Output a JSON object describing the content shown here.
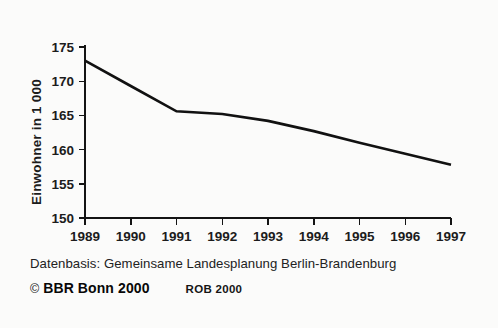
{
  "chart_data": {
    "type": "line",
    "title": "",
    "subtitle": "",
    "xlabel": "",
    "ylabel": "Einwohner in 1 000",
    "x": [
      1989,
      1990,
      1991,
      1992,
      1993,
      1994,
      1995,
      1996,
      1997
    ],
    "categories": [
      "1989",
      "1990",
      "1991",
      "1992",
      "1993",
      "1994",
      "1995",
      "1996",
      "1997"
    ],
    "values": [
      173.0,
      169.3,
      165.6,
      165.2,
      164.2,
      162.7,
      161.0,
      159.4,
      157.8
    ],
    "series": [
      {
        "name": "Einwohner",
        "values": [
          173.0,
          169.3,
          165.6,
          165.2,
          164.2,
          162.7,
          161.0,
          159.4,
          157.8
        ]
      }
    ],
    "ylim": [
      150,
      175
    ],
    "xlim": [
      1989,
      1997
    ],
    "yticks": [
      150,
      155,
      160,
      165,
      170,
      175
    ],
    "ytick_labels": [
      "150",
      "155",
      "160",
      "165",
      "170",
      "175"
    ],
    "xticks": [
      1989,
      1990,
      1991,
      1992,
      1993,
      1994,
      1995,
      1996,
      1997
    ],
    "xtick_labels": [
      "1989",
      "1990",
      "1991",
      "1992",
      "1993",
      "1994",
      "1995",
      "1996",
      "1997"
    ],
    "grid": false,
    "legend": false,
    "legend_position": "none",
    "line_color": "#111111",
    "background_color": "#fbfbfa"
  },
  "footer": {
    "source_note": "Datenbasis: Gemeinsame Landesplanung Berlin-Brandenburg",
    "copyright_symbol": "©",
    "publisher": "BBR Bonn 2000",
    "map_code": "ROB 2000"
  }
}
